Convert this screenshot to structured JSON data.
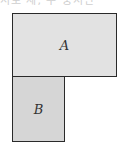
{
  "header": {
    "cut_text": "서로 세, 주 중서만"
  },
  "diagram": {
    "shapes": [
      {
        "id": "A",
        "label": "A",
        "fill": "#e2e2e2"
      },
      {
        "id": "B",
        "label": "B",
        "fill": "#d6d6d6"
      }
    ],
    "border_color": "#2a2a2a"
  }
}
